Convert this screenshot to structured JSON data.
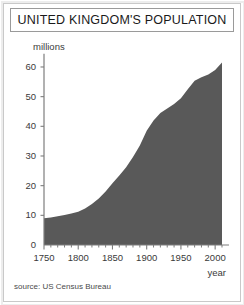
{
  "figure": {
    "title": "UNITED KINGDOM'S POPULATION",
    "source": "source: US Census Bureau",
    "unit_label": "millions",
    "xaxis_name": "year",
    "area_color": "#595959",
    "frame_color": "#9a9a9a",
    "text_color": "#3a3a3a"
  },
  "chart_data": {
    "type": "area",
    "title": "UNITED KINGDOM'S POPULATION",
    "subtitle": "",
    "xlabel": "year",
    "ylabel": "millions",
    "xlim": [
      1750,
      2010
    ],
    "ylim": [
      0,
      65
    ],
    "xticks": [
      1750,
      1800,
      1850,
      1900,
      1950,
      2000
    ],
    "xtick_labels": [
      "1750",
      "1800",
      "1850",
      "1900",
      "1950",
      "2000"
    ],
    "xminor_tick_interval": 10,
    "yticks": [
      0,
      10,
      20,
      30,
      40,
      50,
      60
    ],
    "ytick_labels": [
      "0",
      "10",
      "20",
      "30",
      "40",
      "50",
      "60"
    ],
    "grid": false,
    "legend": null,
    "annotations": [
      "source: US Census Bureau"
    ],
    "series": [
      {
        "name": "United Kingdom population (millions)",
        "x": [
          1750,
          1760,
          1770,
          1780,
          1790,
          1800,
          1810,
          1820,
          1830,
          1840,
          1850,
          1860,
          1870,
          1880,
          1890,
          1900,
          1910,
          1920,
          1930,
          1940,
          1950,
          1960,
          1970,
          1980,
          1990,
          2000,
          2010
        ],
        "values": [
          9.0,
          9.3,
          9.7,
          10.1,
          10.6,
          11.2,
          12.3,
          13.8,
          15.7,
          18.0,
          20.8,
          23.4,
          26.2,
          29.7,
          33.5,
          38.5,
          42.0,
          44.5,
          46.0,
          47.5,
          49.5,
          52.5,
          55.4,
          56.5,
          57.5,
          59.0,
          61.5
        ]
      }
    ]
  },
  "axis_geometry": {
    "origin_x_px": 44,
    "origin_y_px": 245,
    "x_per_year_px": 0.6846,
    "y_per_million_px": 2.967
  }
}
